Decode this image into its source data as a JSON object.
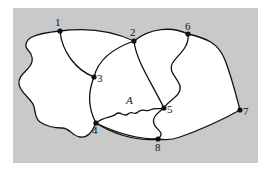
{
  "diagram": {
    "background_color": "#c9c9c9",
    "region_color": "#ffffff",
    "line_color": "#111111",
    "region_label": "A",
    "nodes": [
      {
        "id": "1",
        "label": "1",
        "x": 60,
        "y": 31
      },
      {
        "id": "2",
        "label": "2",
        "x": 134,
        "y": 41
      },
      {
        "id": "3",
        "label": "3",
        "x": 94,
        "y": 77
      },
      {
        "id": "4",
        "label": "4",
        "x": 96,
        "y": 123
      },
      {
        "id": "5",
        "label": "5",
        "x": 164,
        "y": 108
      },
      {
        "id": "6",
        "label": "6",
        "x": 188,
        "y": 34
      },
      {
        "id": "7",
        "label": "7",
        "x": 240,
        "y": 110
      },
      {
        "id": "8",
        "label": "8",
        "x": 158,
        "y": 139
      }
    ],
    "edges": [
      [
        "1",
        "2"
      ],
      [
        "1",
        "3"
      ],
      [
        "1",
        "4"
      ],
      [
        "2",
        "3"
      ],
      [
        "2",
        "5"
      ],
      [
        "2",
        "6"
      ],
      [
        "3",
        "4"
      ],
      [
        "4",
        "5"
      ],
      [
        "4",
        "8"
      ],
      [
        "5",
        "6"
      ],
      [
        "5",
        "8"
      ],
      [
        "6",
        "7"
      ],
      [
        "7",
        "8"
      ]
    ]
  }
}
